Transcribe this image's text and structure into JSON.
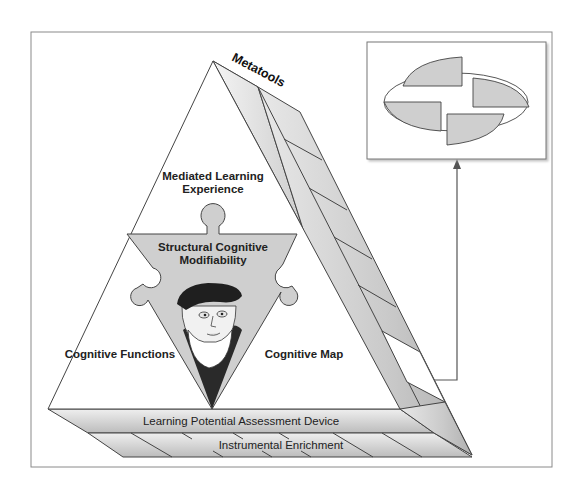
{
  "diagram": {
    "top_label": "Metatools",
    "top_section": {
      "line1": "Mediated Learning",
      "line2": "Experience"
    },
    "center_section": {
      "line1": "Structural Cognitive",
      "line2": "Modifiability"
    },
    "left_section": "Cognitive Functions",
    "right_section": "Cognitive Map",
    "base_band_1": "Learning Potential Assessment Device",
    "base_band_2": "Instrumental Enrichment",
    "center_image": "portrait-of-bearded-man-with-beret",
    "inset": "elliptical-puzzle-of-four-quadrant-pieces",
    "colors": {
      "line": "#444444",
      "piece_fill": "#cfcfcf",
      "slab_light": "#f2f2f2",
      "slab_dark": "#a8a8a8",
      "frame": "#8a8a8a"
    }
  }
}
